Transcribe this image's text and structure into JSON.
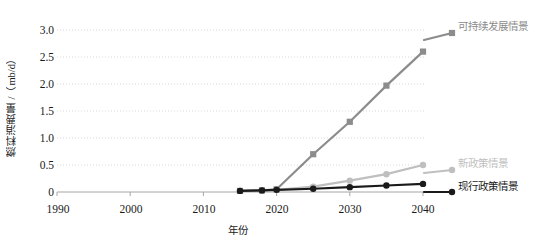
{
  "chart_data": {
    "type": "line",
    "title": "",
    "xlabel": "年份",
    "ylabel": "燃料消费量 /（mb/d）",
    "xlim": [
      1990,
      2040
    ],
    "ylim": [
      0,
      3.0
    ],
    "grid": true,
    "legend_position": "right-inline",
    "xticks": [
      "1990",
      "2000",
      "2010",
      "2020",
      "2030",
      "2040"
    ],
    "xtick_values": [
      1990,
      2000,
      2010,
      2020,
      2030,
      2040
    ],
    "yticks": [
      "0",
      "0.5",
      "1.0",
      "1.5",
      "2.0",
      "2.5",
      "3.0"
    ],
    "ytick_values": [
      0,
      0.5,
      1.0,
      1.5,
      2.0,
      2.5,
      3.0
    ],
    "x": [
      2015,
      2018,
      2020,
      2025,
      2030,
      2035,
      2040
    ],
    "series": [
      {
        "name": "可持续发展情景",
        "color": "#8c8c8c",
        "marker": "square",
        "values": [
          0.02,
          0.03,
          0.05,
          0.7,
          1.3,
          1.97,
          2.6
        ]
      },
      {
        "name": "新政策情景",
        "color": "#bfbfbf",
        "marker": "circle",
        "values": [
          0.02,
          0.03,
          0.04,
          0.1,
          0.21,
          0.33,
          0.5
        ]
      },
      {
        "name": "现行政策情景",
        "color": "#1a1a1a",
        "marker": "circle",
        "values": [
          0.02,
          0.03,
          0.04,
          0.06,
          0.09,
          0.12,
          0.15
        ]
      }
    ]
  },
  "legend": [
    {
      "label": "可持续发展情景",
      "color": "#8c8c8c"
    },
    {
      "label": "新政策情景",
      "color": "#bfbfbf"
    },
    {
      "label": "现行政策情景",
      "color": "#1a1a1a"
    }
  ],
  "axis": {
    "y_title": "燃料消费量 /（mb/d）",
    "x_title": "年份"
  },
  "colors": {
    "grid": "#d9d9d9",
    "axis": "#a6a6a6",
    "text": "#1a1a1a",
    "sustainable": "#8c8c8c",
    "new_policies": "#bfbfbf",
    "current_policies": "#1a1a1a"
  }
}
